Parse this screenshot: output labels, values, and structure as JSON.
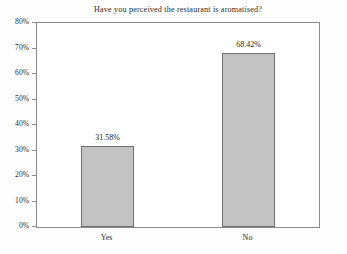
{
  "chart_data": {
    "type": "bar",
    "title": "Have you perceived the restaurant is aromatised?",
    "xlabel": "",
    "ylabel": "",
    "categories": [
      "Yes",
      "No"
    ],
    "values": [
      31.58,
      68.42
    ],
    "value_labels": [
      "31.58%",
      "68.42%"
    ],
    "ylim": [
      0,
      80
    ],
    "ytick_values": [
      0,
      10,
      20,
      30,
      40,
      50,
      60,
      70,
      80
    ],
    "ytick_labels": [
      "0%",
      "10%",
      "20%",
      "30%",
      "40%",
      "50%",
      "60%",
      "70%",
      "80%"
    ],
    "grid": false,
    "legend": null,
    "legend_position": "none",
    "colors": {
      "bar_fill": "#c3c3c3",
      "bar_border": "#6f6f6f",
      "axis": "#8a8a8a",
      "text": "#2a2a2a",
      "background": "#ffffff"
    }
  }
}
